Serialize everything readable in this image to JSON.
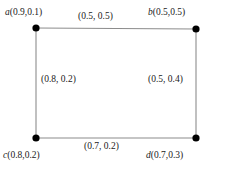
{
  "figure": {
    "type": "graph-diagram",
    "background_color": "#ffffff",
    "edge_color": "#8c8c8c",
    "node_color": "#000000",
    "text_color": "#1a1a1a"
  },
  "vertices": [
    {
      "key": "a",
      "id": "a",
      "value": "(0.9,0.1)",
      "x": 36,
      "y": 28,
      "position": "top-left"
    },
    {
      "key": "b",
      "id": "b",
      "value": "(0.5,0.5)",
      "x": 196,
      "y": 29,
      "position": "top-right"
    },
    {
      "key": "c",
      "id": "c",
      "value": "(0.8,0.2)",
      "x": 36,
      "y": 138,
      "position": "bottom-left"
    },
    {
      "key": "d",
      "id": "d",
      "value": "(0.7,0.3)",
      "x": 196,
      "y": 138,
      "position": "bottom-right"
    }
  ],
  "edges": [
    {
      "key": "top",
      "from": "a",
      "to": "b",
      "label": "(0.5, 0.5)"
    },
    {
      "key": "left",
      "from": "a",
      "to": "c",
      "label": "(0.8, 0.2)"
    },
    {
      "key": "right",
      "from": "b",
      "to": "d",
      "label": "(0.5, 0.4)"
    },
    {
      "key": "bottom",
      "from": "c",
      "to": "d",
      "label": "(0.7, 0.2)"
    }
  ]
}
